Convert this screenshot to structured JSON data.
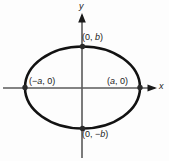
{
  "figure": {
    "background_color": "#fdfdfd",
    "curve_color": "#121212",
    "axis_color": "#5a5a5a",
    "text_color": "#1a1a1a"
  },
  "axes": {
    "x_label": "x",
    "y_label": "y",
    "origin": {
      "x": 82,
      "y": 88
    }
  },
  "labels": {
    "top_vertex": "(0, b)",
    "bottom_vertex": "(0, −b)",
    "left_vertex": "(−a, 0)",
    "right_vertex": "(a, 0)"
  },
  "chart_data": {
    "type": "scatter",
    "title": "",
    "xlabel": "x",
    "ylabel": "y",
    "shape": "ellipse",
    "center": [
      0,
      0
    ],
    "semi_major_axis_a": 1,
    "semi_minor_axis_b": 0.7,
    "vertices": [
      {
        "label": "(0, b)",
        "x": 0,
        "y": 0.7
      },
      {
        "label": "(a, 0)",
        "x": 1,
        "y": 0
      },
      {
        "label": "(0, −b)",
        "x": 0,
        "y": -0.7
      },
      {
        "label": "(−a, 0)",
        "x": -1,
        "y": 0
      }
    ],
    "equation": "x^2/a^2 + y^2/b^2 = 1",
    "grid": false,
    "legend": false
  }
}
